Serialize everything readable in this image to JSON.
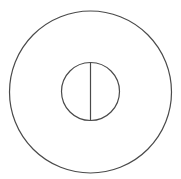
{
  "canvas": {
    "width": 181,
    "height": 179,
    "background": "#ffffff"
  },
  "style": {
    "stroke": "#4a4a4a",
    "stroke_width": 1.2
  },
  "shapes": {
    "outer_circle": {
      "cx": 90.5,
      "cy": 92,
      "r": 81
    },
    "inner_circle": {
      "cx": 90.5,
      "cy": 91.5,
      "r": 29
    },
    "divider_line": {
      "x1": 90.5,
      "y1": 62.5,
      "x2": 90.5,
      "y2": 120.5
    }
  }
}
